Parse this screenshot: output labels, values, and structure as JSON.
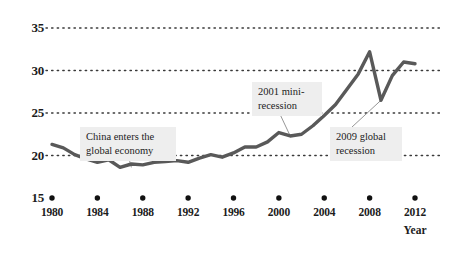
{
  "chart_data": {
    "type": "line",
    "title": "",
    "xlabel": "Year",
    "ylabel": "",
    "xlim": [
      1979,
      2013
    ],
    "ylim": [
      15,
      35
    ],
    "grid": true,
    "legend": "none",
    "line_color": "#595959",
    "y_ticks": [
      "35",
      "30",
      "25",
      "20",
      "15"
    ],
    "y_tick_values": [
      35,
      30,
      25,
      20,
      15
    ],
    "x_ticks": [
      "1980",
      "1984",
      "1988",
      "1992",
      "1996",
      "2000",
      "2004",
      "2008",
      "2012"
    ],
    "x_tick_values": [
      1980,
      1984,
      1988,
      1992,
      1996,
      2000,
      2004,
      2008,
      2012
    ],
    "x": [
      1980,
      1981,
      1982,
      1983,
      1984,
      1985,
      1986,
      1987,
      1988,
      1989,
      1990,
      1991,
      1992,
      1993,
      1994,
      1995,
      1996,
      1997,
      1998,
      1999,
      2000,
      2001,
      2002,
      2003,
      2004,
      2005,
      2006,
      2007,
      2008,
      2009,
      2010,
      2011,
      2012
    ],
    "values": [
      21.3,
      20.9,
      20.1,
      19.6,
      19.2,
      19.5,
      18.6,
      19.0,
      18.9,
      19.2,
      19.3,
      19.4,
      19.2,
      19.7,
      20.1,
      19.8,
      20.3,
      21.0,
      21.0,
      21.6,
      22.7,
      22.3,
      22.5,
      23.5,
      24.7,
      26.0,
      27.8,
      29.6,
      32.2,
      26.5,
      29.4,
      31.0,
      30.8
    ],
    "annotations": [
      {
        "id": "china-entry",
        "text": "China enters the\nglobal economy",
        "target_x": 1987,
        "target_y": 18.6
      },
      {
        "id": "mini-recession-2001",
        "text": "2001 mini-\nrecession",
        "target_x": 2001,
        "target_y": 22.3
      },
      {
        "id": "global-recession-2009",
        "text": "2009 global\nrecession",
        "target_x": 2009,
        "target_y": 26.5
      }
    ]
  }
}
